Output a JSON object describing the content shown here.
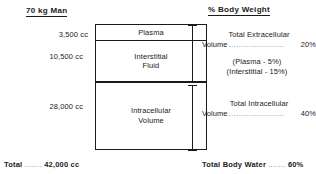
{
  "headings": {
    "left": "70 kg Man",
    "right": "% Body Weight"
  },
  "volumes": {
    "plasma": "3,500 cc",
    "interstitial": "10,500 cc",
    "intracellular": "28,000 cc"
  },
  "compartments": {
    "plasma": "Plasma",
    "interstitial": "Interstitial\nFluid",
    "interstitial_line1": "Interstitial",
    "interstitial_line2": "Fluid",
    "intracellular_line1": "Intracellular",
    "intracellular_line2": "Volume"
  },
  "descriptions": {
    "extracellular": {
      "title": "Total Extracellular",
      "label": "Volume",
      "dots": "......................",
      "value": "20%"
    },
    "intracellular": {
      "title": "Total Intracellular",
      "label": "Volume",
      "dots": "......................",
      "value": "40%"
    },
    "plasma_note": "(Plasma - 5%)",
    "interstitial_note": "(Interstitial - 15%)"
  },
  "totals": {
    "left_label": "Total",
    "left_dots": ".......",
    "left_value": "42,000 cc",
    "right_label": "Total Body Water",
    "right_dots": ".......",
    "right_value": "60%"
  },
  "chart_data": {
    "type": "bar",
    "categories": [
      "Plasma",
      "Interstitial Fluid",
      "Intracellular Volume"
    ],
    "values": [
      3500,
      10500,
      28000
    ],
    "value_labels": [
      "3,500 cc",
      "10,500 cc",
      "28,000 cc"
    ],
    "percent_body_weight": [
      5,
      15,
      40
    ],
    "groups": [
      {
        "name": "Total Extracellular Volume",
        "members": [
          "Plasma",
          "Interstitial Fluid"
        ],
        "volume_cc": 14000,
        "percent_body_weight": 20
      },
      {
        "name": "Total Intracellular Volume",
        "members": [
          "Intracellular Volume"
        ],
        "volume_cc": 28000,
        "percent_body_weight": 40
      }
    ],
    "total_volume_cc": 42000,
    "total_body_water_percent": 60,
    "xlabel": "",
    "ylabel": "Volume (cc)",
    "units": "cc",
    "grid": false,
    "legend": "none",
    "orientation": "vertical-stacked"
  }
}
